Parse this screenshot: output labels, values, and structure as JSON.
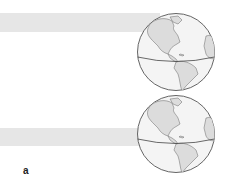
{
  "figure": {
    "label": "a",
    "colors": {
      "band": "#e6e6e6",
      "ocean": "#f4f4f4",
      "land": "#dcdcdc",
      "outline": "#555555"
    },
    "panels": [
      {
        "name": "top",
        "band_position": "northern-hemisphere"
      },
      {
        "name": "bottom",
        "band_position": "equator"
      }
    ]
  }
}
